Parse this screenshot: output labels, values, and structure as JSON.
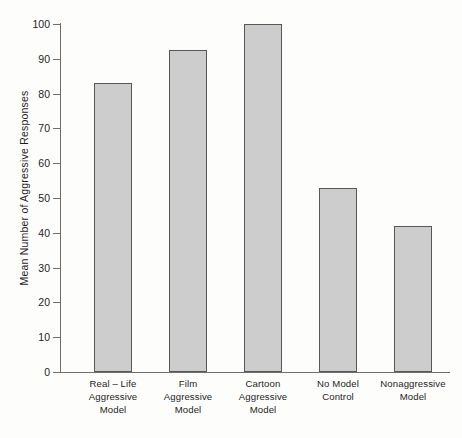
{
  "chart_data": {
    "type": "bar",
    "title": "",
    "subtitle": "",
    "xlabel": "",
    "ylabel": "Mean Number of Aggressive Responses",
    "ylim": [
      0,
      100
    ],
    "yticks": [
      0,
      10,
      20,
      30,
      40,
      50,
      60,
      70,
      80,
      90,
      100
    ],
    "ytick_labels": [
      "0",
      "10",
      "20",
      "30",
      "40",
      "50",
      "60",
      "70",
      "80",
      "90",
      "100"
    ],
    "grid": false,
    "legend": null,
    "categories": [
      "Real - Life Aggressive Model",
      "Film Aggressive Model",
      "Cartoon Aggressive Model",
      "No Model Control",
      "Nonaggressive Model"
    ],
    "category_lines": [
      [
        "Real – Life",
        "Aggressive",
        "Model"
      ],
      [
        "Film",
        "Aggressive",
        "Model"
      ],
      [
        "Cartoon",
        "Aggressive",
        "Model"
      ],
      [
        "No Model",
        "Control"
      ],
      [
        "Nonaggressive",
        "Model"
      ]
    ],
    "values": [
      83,
      92.5,
      100,
      53,
      42
    ],
    "bar_color": "#cdcdcd",
    "bar_edge_color": "#585858",
    "axis_color": "#6e6e6e",
    "background_color": "#fdfdfc",
    "text_color": "#1d1d1d"
  }
}
